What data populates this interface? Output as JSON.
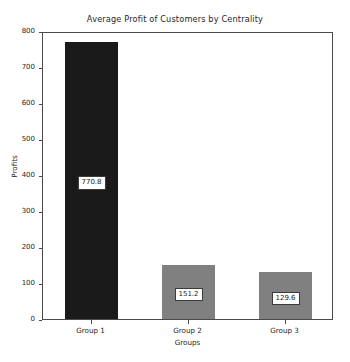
{
  "chart_data": {
    "type": "bar",
    "title": "Average Profit of Customers by Centrality",
    "xlabel": "Groups",
    "ylabel": "Profits",
    "categories": [
      "Group 1",
      "Group 2",
      "Group 3"
    ],
    "values": [
      770.8,
      151.2,
      129.6
    ],
    "value_labels": [
      "770.8",
      "151.2",
      "129.6"
    ],
    "bar_colors": [
      "#1a1a1a",
      "#808080",
      "#808080"
    ],
    "ylim": [
      0,
      800
    ],
    "yticks": [
      0,
      100,
      200,
      300,
      400,
      500,
      600,
      700,
      800
    ],
    "ytick_labels": [
      "0",
      "100",
      "200",
      "300",
      "400",
      "500",
      "600",
      "700",
      "800"
    ],
    "grid": false,
    "legend": false,
    "background": "#ffffff",
    "frame_color": "#4a4a4a",
    "label_box_background": "#ffffff",
    "label_box_border": "#3a3a3a"
  }
}
